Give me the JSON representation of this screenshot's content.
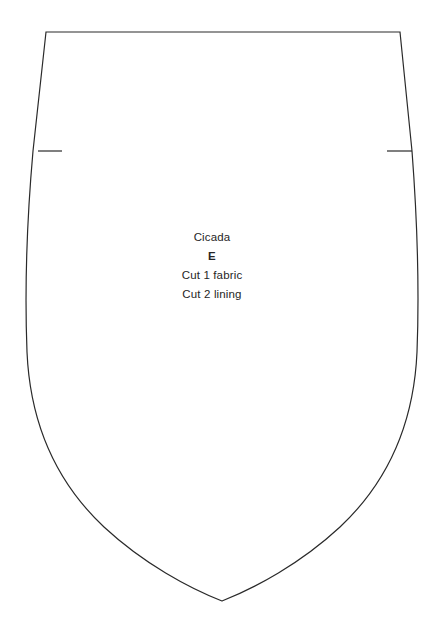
{
  "document": {
    "kind": "sewing-pattern-piece",
    "background_color": "#ffffff",
    "line_color": "#2a2a2a",
    "line_width": 1.2,
    "canvas": {
      "width": 440,
      "height": 629
    }
  },
  "piece": {
    "name": "Cicada",
    "letter": "E",
    "cut_instruction_fabric": "Cut 1 fabric",
    "cut_instruction_lining": "Cut 2 lining"
  },
  "geometry": {
    "outline_path": "M 46 32 L 400 32 L 412 151 C 418 230 419 300 417 352 C 414 420 390 480 340 527 C 300 564 255 588 222 601 C 189 588 144 564 104 527 C 54 480 30 420 27 352 C 25 300 26 230 33 151 Z",
    "notch_left": {
      "x1": 38,
      "y1": 151,
      "x2": 62,
      "y2": 151
    },
    "notch_right": {
      "x1": 412,
      "y1": 151,
      "x2": 387,
      "y2": 151
    },
    "top_edge": {
      "x1": 46,
      "y1": 32,
      "x2": 400,
      "y2": 32
    },
    "bottom_point": {
      "x": 222,
      "y": 601
    },
    "widest_left_x": 26,
    "widest_right_x": 418
  },
  "chart_data": {
    "type": "table",
    "title": "Cicada",
    "categories": [
      "Piece name",
      "Piece letter",
      "Fabric cut",
      "Lining cut"
    ],
    "values": [
      "Cicada",
      "E",
      1,
      2
    ]
  }
}
